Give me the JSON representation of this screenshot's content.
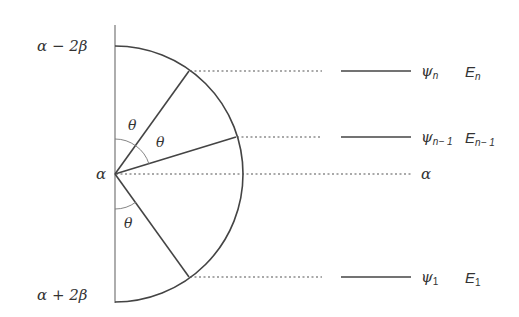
{
  "axis_labels": {
    "top": "α − 2β",
    "center": "α",
    "bottom": "α + 2β"
  },
  "angle_labels": [
    "θ",
    "θ",
    "θ"
  ],
  "levels": [
    {
      "psi": "ψ",
      "psi_sub": "n",
      "energy": "E",
      "energy_sub": "n"
    },
    {
      "psi": "ψ",
      "psi_sub": "n− 1",
      "energy": "E",
      "energy_sub": "n− 1"
    },
    {
      "alpha_label": "α"
    },
    {
      "psi": "ψ",
      "psi_sub": "1",
      "energy": "E",
      "energy_sub": "1"
    }
  ],
  "colors": {
    "line": "#444444",
    "axis": "#777777",
    "text": "#333333"
  }
}
